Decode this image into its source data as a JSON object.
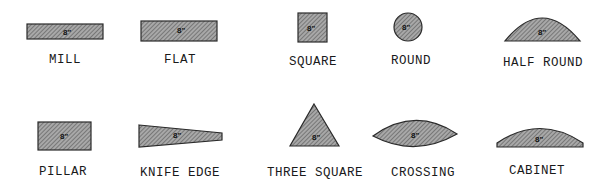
{
  "size_mark": "8\"",
  "colors": {
    "fill": "#9a9a9a",
    "hatch": "#5a5a5a",
    "outline": "#2a2a2a",
    "text": "#1a1a1a"
  },
  "shapes": [
    {
      "id": "mill",
      "label": "MILL"
    },
    {
      "id": "flat",
      "label": "FLAT"
    },
    {
      "id": "square",
      "label": "SQUARE"
    },
    {
      "id": "round",
      "label": "ROUND"
    },
    {
      "id": "half-round",
      "label": "HALF ROUND"
    },
    {
      "id": "pillar",
      "label": "PILLAR"
    },
    {
      "id": "knife-edge",
      "label": "KNIFE EDGE"
    },
    {
      "id": "three-square",
      "label": "THREE SQUARE"
    },
    {
      "id": "crossing",
      "label": "CROSSING"
    },
    {
      "id": "cabinet",
      "label": "CABINET"
    }
  ]
}
